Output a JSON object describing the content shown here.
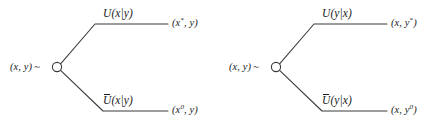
{
  "figure": {
    "type": "decision-tree-pair",
    "background_color": "#ffffff",
    "line_color": "#3a3a3a",
    "text_color": "#1a1a1a",
    "node_shape": "open-circle"
  },
  "trees": [
    {
      "id": "tree-left",
      "root": {
        "label_pair": "(x, y)",
        "tilde": "~",
        "node_name": "chance-node"
      },
      "upper": {
        "branch_label_base": "U",
        "branch_label_arg": "(x|y)",
        "overbar": false,
        "outcome_open": "(",
        "outcome_var": "x",
        "outcome_sup": "*",
        "outcome_rest": ", y)"
      },
      "lower": {
        "branch_label_base": "U",
        "branch_label_arg": "(x|y)",
        "overbar": true,
        "outcome_open": "(",
        "outcome_var": "x",
        "outcome_sup": "0",
        "outcome_rest": ", y)"
      }
    },
    {
      "id": "tree-right",
      "root": {
        "label_pair": "(x, y)",
        "tilde": "~",
        "node_name": "chance-node"
      },
      "upper": {
        "branch_label_base": "U",
        "branch_label_arg": "(y|x)",
        "overbar": false,
        "outcome_open": "(x, ",
        "outcome_var": "y",
        "outcome_sup": "*",
        "outcome_rest": ")"
      },
      "lower": {
        "branch_label_base": "U",
        "branch_label_arg": "(y|x)",
        "overbar": true,
        "outcome_open": "(x, ",
        "outcome_var": "y",
        "outcome_sup": "0",
        "outcome_rest": ")"
      }
    }
  ]
}
